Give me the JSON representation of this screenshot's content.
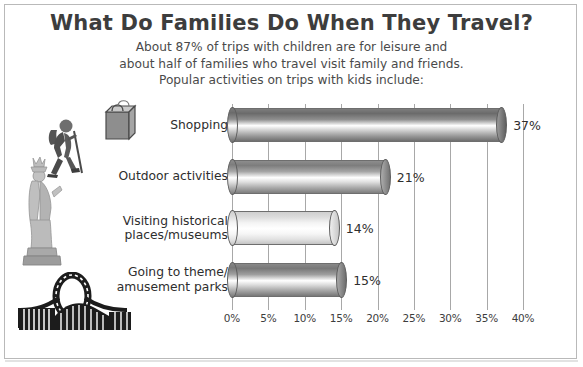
{
  "header": {
    "title": "What Do Families Do When They Travel?",
    "subtitle_lines": [
      "About 87% of trips with children are for leisure and",
      "about half of families who travel visit family and friends.",
      "Popular activities on trips with kids include:"
    ]
  },
  "colors": {
    "title": "#3d3d3d",
    "text": "#2e2e2e",
    "gridline": "#a8a8a8",
    "border": "#b9b9b9",
    "background": "#ffffff",
    "bar_dark": "#6e6e6e",
    "bar_light": "#f2f2f2"
  },
  "icons": [
    {
      "name": "shopping-bag-icon",
      "label": "shopping bag"
    },
    {
      "name": "hiker-icon",
      "label": "hiker with backpack"
    },
    {
      "name": "statue-of-liberty-icon",
      "label": "Statue of Liberty"
    },
    {
      "name": "roller-coaster-icon",
      "label": "roller coaster"
    }
  ],
  "chart_data": {
    "type": "bar",
    "orientation": "horizontal",
    "title": "What Do Families Do When They Travel?",
    "xlabel": "",
    "ylabel": "",
    "xlim": [
      0,
      40
    ],
    "grid": true,
    "legend": false,
    "categories": [
      "Shopping",
      "Outdoor activities",
      "Visiting historical places/museums",
      "Going to theme/ amusement parks"
    ],
    "category_lines": [
      [
        "Shopping"
      ],
      [
        "Outdoor activities"
      ],
      [
        "Visiting historical",
        "places/museums"
      ],
      [
        "Going to theme/",
        "amusement parks"
      ]
    ],
    "values": [
      37,
      21,
      14,
      15
    ],
    "value_labels": [
      "37%",
      "21%",
      "14%",
      "15%"
    ],
    "tick_values": [
      0,
      5,
      10,
      15,
      20,
      25,
      30,
      35,
      40
    ],
    "tick_labels": [
      "0%",
      "5%",
      "10%",
      "15%",
      "20%",
      "25%",
      "30%",
      "35%",
      "40%"
    ],
    "bar_shades": [
      "dark",
      "medium",
      "light",
      "medium-dark"
    ]
  }
}
